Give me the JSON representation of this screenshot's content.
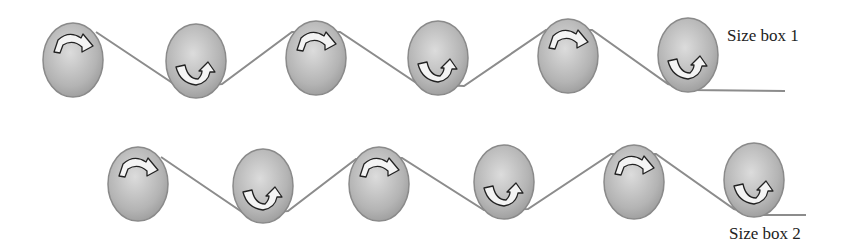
{
  "diagram": {
    "rows": [
      {
        "label": "Size box 1",
        "label_pos": {
          "x": 727,
          "y": 26
        },
        "ellipses": [
          {
            "cx": 73,
            "cy": 60,
            "arrow": "top"
          },
          {
            "cx": 196,
            "cy": 61,
            "arrow": "bottom"
          },
          {
            "cx": 316,
            "cy": 58,
            "arrow": "top"
          },
          {
            "cx": 438,
            "cy": 58,
            "arrow": "bottom"
          },
          {
            "cx": 568,
            "cy": 56,
            "arrow": "top"
          },
          {
            "cx": 688,
            "cy": 55,
            "arrow": "bottom"
          }
        ],
        "line_points": [
          [
            96,
            32
          ],
          [
            180,
            88
          ],
          [
            222,
            84
          ],
          [
            292,
            32
          ],
          [
            340,
            32
          ],
          [
            418,
            84
          ],
          [
            464,
            86
          ],
          [
            546,
            30
          ],
          [
            592,
            30
          ],
          [
            668,
            84
          ],
          [
            690,
            90
          ],
          [
            785,
            91
          ]
        ]
      },
      {
        "label": "Size box 2",
        "label_pos": {
          "x": 729,
          "y": 224
        },
        "ellipses": [
          {
            "cx": 138,
            "cy": 184,
            "arrow": "top"
          },
          {
            "cx": 263,
            "cy": 186,
            "arrow": "bottom"
          },
          {
            "cx": 379,
            "cy": 184,
            "arrow": "top"
          },
          {
            "cx": 504,
            "cy": 182,
            "arrow": "bottom"
          },
          {
            "cx": 634,
            "cy": 182,
            "arrow": "top"
          },
          {
            "cx": 754,
            "cy": 180,
            "arrow": "bottom"
          }
        ],
        "line_points": [
          [
            161,
            157
          ],
          [
            245,
            214
          ],
          [
            288,
            211
          ],
          [
            356,
            159
          ],
          [
            402,
            158
          ],
          [
            484,
            210
          ],
          [
            528,
            209
          ],
          [
            611,
            154
          ],
          [
            656,
            154
          ],
          [
            734,
            209
          ],
          [
            756,
            215
          ],
          [
            806,
            215
          ]
        ]
      }
    ],
    "ellipse_rx": 30,
    "ellipse_ry": 37,
    "colors": {
      "ellipse_fill_light": "#d4d4d4",
      "ellipse_fill_dark": "#9a9a9a",
      "ellipse_stroke": "#8a8a8a",
      "line": "#8c8c8c",
      "arrow_fill": "#f4f4f4",
      "arrow_stroke": "#222222"
    }
  }
}
